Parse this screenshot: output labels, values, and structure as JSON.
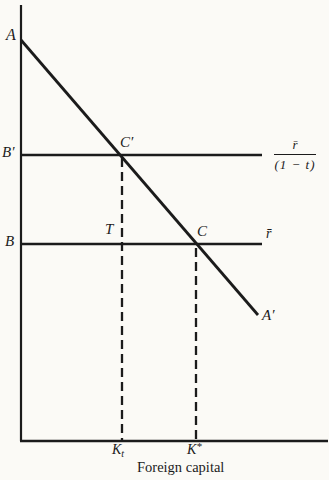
{
  "colors": {
    "ink": "#1b1b1b",
    "paper": "#fbfaf6"
  },
  "figure": {
    "xlabel": "Foreign capital",
    "labels": {
      "A": "A",
      "A_prime": "A′",
      "B_prime": "B′",
      "B": "B",
      "C_prime": "C′",
      "C": "C",
      "T": "T",
      "r_bar": "r̄",
      "frac_numerator": "r̄",
      "frac_denominator": "(1 − t)",
      "K_t": {
        "base": "K",
        "sub": "t"
      },
      "K_star": {
        "base": "K",
        "sup": "*"
      }
    }
  },
  "geometry": {
    "lines": [
      {
        "name": "y-axis",
        "x1": 21,
        "y1": 5,
        "x2": 21,
        "y2": 441,
        "w": 2.2
      },
      {
        "name": "x-axis",
        "x1": 20,
        "y1": 441,
        "x2": 328,
        "y2": 441,
        "w": 2.4
      },
      {
        "name": "schedule-line-AA",
        "x1": 21,
        "y1": 40,
        "x2": 258,
        "y2": 315,
        "w": 2.8
      },
      {
        "name": "line-B-prime",
        "x1": 21,
        "y1": 155,
        "x2": 262,
        "y2": 155,
        "w": 2.4
      },
      {
        "name": "line-B",
        "x1": 21,
        "y1": 244,
        "x2": 262,
        "y2": 244,
        "w": 2.4
      },
      {
        "name": "dashed-line-Kt",
        "x1": 122,
        "y1": 158,
        "x2": 122,
        "y2": 440,
        "w": 2.3,
        "dash": "9 5"
      },
      {
        "name": "dashed-line-Kstar",
        "x1": 196,
        "y1": 248,
        "x2": 196,
        "y2": 440,
        "w": 2.3,
        "dash": "9 5"
      }
    ]
  }
}
